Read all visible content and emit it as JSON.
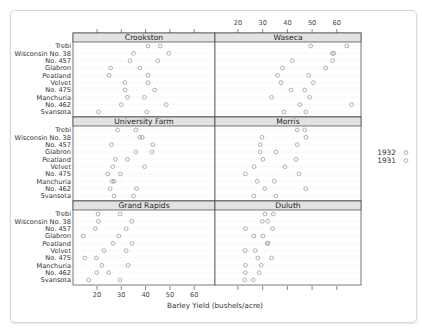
{
  "chart_data": {
    "type": "scatter",
    "subtype": "multi-panel dot plot",
    "title": "",
    "xlabel": "Barley Yield (bushels/acre)",
    "ylabel": "",
    "xlim": [
      10,
      70
    ],
    "xticks": [
      20,
      30,
      40,
      50,
      60
    ],
    "grid": "horizontal dotted row guides",
    "legend": {
      "position": "right",
      "entries": [
        "1932",
        "1931"
      ]
    },
    "varieties": [
      "Trebi",
      "Wisconsin No. 38",
      "No. 457",
      "Glabron",
      "Peatland",
      "Velvet",
      "No. 475",
      "Manchuria",
      "No. 462",
      "Svansota"
    ],
    "panels": [
      {
        "site": "Crookston",
        "col": 0,
        "row": 0,
        "y1932": [
          41.0,
          35.0,
          33.6,
          25.6,
          25.0,
          31.5,
          31.6,
          32.5,
          30.0,
          20.6
        ],
        "y1931": [
          46.0,
          49.5,
          45.0,
          37.6,
          41.0,
          41.0,
          43.7,
          39.5,
          48.5,
          40.5
        ]
      },
      {
        "site": "Waseca",
        "col": 1,
        "row": 0,
        "y1932": [
          49.4,
          58.2,
          42.0,
          38.0,
          36.0,
          37.4,
          41.5,
          33.6,
          45.0,
          38.6
        ],
        "y1931": [
          64.0,
          58.8,
          58.3,
          55.5,
          48.6,
          50.5,
          47.0,
          49.0,
          66.0,
          47.5
        ]
      },
      {
        "site": "University Farm",
        "col": 0,
        "row": 1,
        "y1932": [
          28.5,
          37.6,
          26.0,
          36.0,
          27.6,
          26.5,
          24.4,
          26.3,
          25.4,
          27.0
        ],
        "y1931": [
          36.0,
          38.6,
          43.0,
          42.6,
          32.5,
          39.6,
          29.6,
          27.0,
          36.3,
          35.0
        ]
      },
      {
        "site": "Morris",
        "col": 1,
        "row": 1,
        "y1932": [
          44.0,
          29.7,
          29.0,
          29.0,
          30.1,
          26.5,
          23.0,
          27.8,
          30.8,
          26.4
        ],
        "y1931": [
          47.0,
          47.5,
          44.0,
          35.4,
          43.5,
          39.0,
          44.7,
          34.7,
          47.4,
          35.3
        ]
      },
      {
        "site": "Grand Rapids",
        "col": 0,
        "row": 2,
        "y1932": [
          20.4,
          20.6,
          19.3,
          14.4,
          26.6,
          22.9,
          15.0,
          22.0,
          19.9,
          16.6
        ],
        "y1931": [
          29.5,
          34.3,
          32.0,
          29.0,
          34.5,
          32.0,
          19.7,
          32.8,
          24.8,
          29.5
        ]
      },
      {
        "site": "Duluth",
        "col": 1,
        "row": 2,
        "y1932": [
          31.0,
          29.8,
          23.0,
          26.4,
          31.8,
          22.9,
          28.0,
          23.0,
          23.0,
          22.7
        ],
        "y1931": [
          34.3,
          32.0,
          34.0,
          30.1,
          32.2,
          27.0,
          33.6,
          29.4,
          28.6,
          26.2
        ]
      }
    ]
  },
  "colors": {
    "strip": "#e2e2e2",
    "border": "#555555",
    "point": "#909090",
    "guide": "#d4d4d4"
  }
}
